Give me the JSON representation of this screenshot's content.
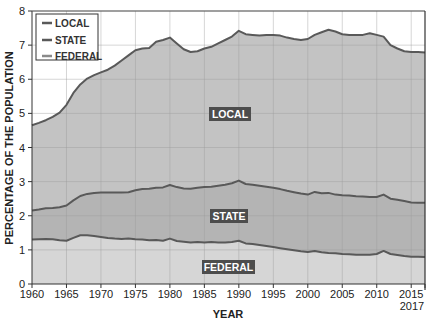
{
  "chart_data": {
    "type": "area",
    "stacked": true,
    "title": "",
    "xlabel": "YEAR",
    "ylabel": "PERCENTAGE OF THE POPULATION",
    "xlim": [
      1960,
      2017
    ],
    "ylim": [
      0,
      8
    ],
    "x_ticks": [
      "1960",
      "1965",
      "1970",
      "1975",
      "1980",
      "1985",
      "1990",
      "1995",
      "2000",
      "2005",
      "2010",
      "2015",
      "2017"
    ],
    "y_ticks": [
      "0",
      "1",
      "2",
      "3",
      "4",
      "5",
      "6",
      "7",
      "8"
    ],
    "grid": true,
    "legend_position": "upper-left",
    "legend": [
      "LOCAL",
      "STATE",
      "FEDERAL"
    ],
    "area_labels": [
      "LOCAL",
      "STATE",
      "FEDERAL"
    ],
    "x": [
      1960,
      1961,
      1962,
      1963,
      1964,
      1965,
      1966,
      1967,
      1968,
      1969,
      1970,
      1971,
      1972,
      1973,
      1974,
      1975,
      1976,
      1977,
      1978,
      1979,
      1980,
      1981,
      1982,
      1983,
      1984,
      1985,
      1986,
      1987,
      1988,
      1989,
      1990,
      1991,
      1992,
      1993,
      1994,
      1995,
      1996,
      1997,
      1998,
      1999,
      2000,
      2001,
      2002,
      2003,
      2004,
      2005,
      2006,
      2007,
      2008,
      2009,
      2010,
      2011,
      2012,
      2013,
      2014,
      2015,
      2016,
      2017
    ],
    "series": [
      {
        "name": "FEDERAL",
        "cumulative_top": [
          1.3,
          1.31,
          1.32,
          1.31,
          1.28,
          1.27,
          1.35,
          1.43,
          1.43,
          1.41,
          1.38,
          1.35,
          1.33,
          1.32,
          1.33,
          1.31,
          1.3,
          1.28,
          1.29,
          1.27,
          1.33,
          1.26,
          1.24,
          1.22,
          1.23,
          1.22,
          1.23,
          1.22,
          1.22,
          1.23,
          1.27,
          1.19,
          1.17,
          1.14,
          1.11,
          1.08,
          1.05,
          1.02,
          0.99,
          0.96,
          0.94,
          0.97,
          0.93,
          0.91,
          0.9,
          0.88,
          0.87,
          0.86,
          0.86,
          0.86,
          0.88,
          0.97,
          0.88,
          0.85,
          0.82,
          0.8,
          0.8,
          0.79
        ]
      },
      {
        "name": "STATE",
        "cumulative_top": [
          2.15,
          2.18,
          2.22,
          2.23,
          2.25,
          2.3,
          2.45,
          2.58,
          2.64,
          2.67,
          2.68,
          2.68,
          2.68,
          2.68,
          2.69,
          2.75,
          2.78,
          2.79,
          2.82,
          2.83,
          2.9,
          2.84,
          2.8,
          2.79,
          2.82,
          2.84,
          2.85,
          2.88,
          2.91,
          2.95,
          3.03,
          2.93,
          2.91,
          2.88,
          2.85,
          2.82,
          2.78,
          2.73,
          2.69,
          2.65,
          2.62,
          2.7,
          2.66,
          2.67,
          2.62,
          2.6,
          2.59,
          2.57,
          2.56,
          2.55,
          2.55,
          2.62,
          2.5,
          2.47,
          2.43,
          2.39,
          2.38,
          2.38
        ]
      },
      {
        "name": "LOCAL",
        "cumulative_top": [
          4.65,
          4.72,
          4.8,
          4.9,
          5.02,
          5.25,
          5.6,
          5.85,
          6.02,
          6.12,
          6.2,
          6.28,
          6.4,
          6.55,
          6.7,
          6.85,
          6.9,
          6.92,
          7.1,
          7.15,
          7.22,
          7.05,
          6.88,
          6.8,
          6.82,
          6.9,
          6.95,
          7.05,
          7.15,
          7.25,
          7.42,
          7.32,
          7.3,
          7.28,
          7.3,
          7.3,
          7.28,
          7.22,
          7.18,
          7.15,
          7.18,
          7.3,
          7.38,
          7.45,
          7.4,
          7.32,
          7.3,
          7.3,
          7.3,
          7.35,
          7.3,
          7.25,
          7.0,
          6.9,
          6.82,
          6.8,
          6.8,
          6.78
        ]
      }
    ]
  },
  "axes": {
    "x_title": "YEAR",
    "y_title": "PERCENTAGE OF THE POPULATION"
  },
  "legend": {
    "items": [
      {
        "label": "LOCAL"
      },
      {
        "label": "STATE"
      },
      {
        "label": "FEDERAL"
      }
    ]
  },
  "labels": {
    "local": "LOCAL",
    "state": "STATE",
    "federal": "FEDERAL"
  },
  "colors": {
    "local_fill": "#c3c3c3",
    "state_fill": "#b4b4b4",
    "federal_fill": "#d6d6d6",
    "line": "#595959",
    "grid": "#9a9a9a",
    "label_bg": "#4d4d4d"
  }
}
